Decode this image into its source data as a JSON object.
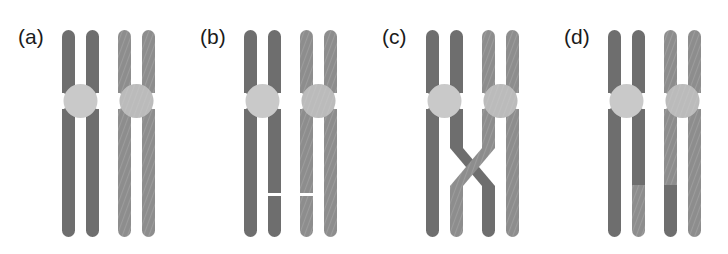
{
  "figure": {
    "background_color": "#ffffff",
    "width": 728,
    "height": 254,
    "colors": {
      "chromatid_dark": "#6e6e6e",
      "chromatid_light": "#8d8d8d",
      "centromere": "#c9c9c9",
      "break_line": "#ffffff",
      "label_text": "#1b1b1b"
    },
    "geometry": {
      "chromatid_width": 13,
      "chromatid_top_y": 30,
      "chromatid_bottom_y": 237,
      "centromere_center_y": 101,
      "centromere_radius": 17,
      "panel_width": 182,
      "chromatid_x_offsets": [
        62,
        86,
        118,
        142
      ],
      "break_line_y": 193,
      "crossover_y_top": 148,
      "crossover_y_bottom": 186
    }
  },
  "panels": [
    {
      "label": "(a)",
      "name": "panel-a",
      "caption_state": "paired homologous chromosomes, each with two sister chromatids, no breaks",
      "x": 0,
      "chromosomes": [
        {
          "name": "maternal-chromosome",
          "shade": "dark",
          "chromatids": [
            {
              "name": "chromatid-1",
              "shade": "dark",
              "break": false,
              "lower_segment_shade": "dark"
            },
            {
              "name": "chromatid-2",
              "shade": "dark",
              "break": false,
              "lower_segment_shade": "dark"
            }
          ]
        },
        {
          "name": "paternal-chromosome",
          "shade": "light",
          "chromatids": [
            {
              "name": "chromatid-3",
              "shade": "light",
              "break": false,
              "lower_segment_shade": "light"
            },
            {
              "name": "chromatid-4",
              "shade": "light",
              "break": false,
              "lower_segment_shade": "light"
            }
          ]
        }
      ],
      "crossover": false,
      "breaks": []
    },
    {
      "label": "(b)",
      "name": "panel-b",
      "caption_state": "double-strand breaks appear on the inner chromatids",
      "x": 182,
      "chromosomes": [
        {
          "name": "maternal-chromosome",
          "shade": "dark",
          "chromatids": [
            {
              "name": "chromatid-1",
              "shade": "dark",
              "break": false,
              "lower_segment_shade": "dark"
            },
            {
              "name": "chromatid-2",
              "shade": "dark",
              "break": true,
              "lower_segment_shade": "dark"
            }
          ]
        },
        {
          "name": "paternal-chromosome",
          "shade": "light",
          "chromatids": [
            {
              "name": "chromatid-3",
              "shade": "light",
              "break": true,
              "lower_segment_shade": "light"
            },
            {
              "name": "chromatid-4",
              "shade": "light",
              "break": false,
              "lower_segment_shade": "light"
            }
          ]
        }
      ],
      "crossover": false,
      "breaks": [
        "chromatid-2",
        "chromatid-3"
      ]
    },
    {
      "label": "(c)",
      "name": "panel-c",
      "caption_state": "broken ends join forming a chiasma (crossover X) between inner chromatids",
      "x": 364,
      "chromosomes": [
        {
          "name": "maternal-chromosome",
          "shade": "dark",
          "chromatids": [
            {
              "name": "chromatid-1",
              "shade": "dark",
              "break": false,
              "lower_segment_shade": "dark"
            },
            {
              "name": "chromatid-2",
              "shade": "dark",
              "break": false,
              "lower_segment_shade": "dark"
            }
          ]
        },
        {
          "name": "paternal-chromosome",
          "shade": "light",
          "chromatids": [
            {
              "name": "chromatid-3",
              "shade": "light",
              "break": false,
              "lower_segment_shade": "light"
            },
            {
              "name": "chromatid-4",
              "shade": "light",
              "break": false,
              "lower_segment_shade": "light"
            }
          ]
        }
      ],
      "crossover": true,
      "breaks": []
    },
    {
      "label": "(d)",
      "name": "panel-d",
      "caption_state": "recombinant chromatids after resolution: distal segments have been exchanged",
      "x": 546,
      "chromosomes": [
        {
          "name": "maternal-chromosome",
          "shade": "dark",
          "chromatids": [
            {
              "name": "chromatid-1",
              "shade": "dark",
              "break": false,
              "lower_segment_shade": "dark"
            },
            {
              "name": "chromatid-2",
              "shade": "dark",
              "break": false,
              "lower_segment_shade": "light"
            }
          ]
        },
        {
          "name": "paternal-chromosome",
          "shade": "light",
          "chromatids": [
            {
              "name": "chromatid-3",
              "shade": "light",
              "break": false,
              "lower_segment_shade": "dark"
            },
            {
              "name": "chromatid-4",
              "shade": "light",
              "break": false,
              "lower_segment_shade": "light"
            }
          ]
        }
      ],
      "crossover": false,
      "breaks": [],
      "exchange_y": 185
    }
  ]
}
